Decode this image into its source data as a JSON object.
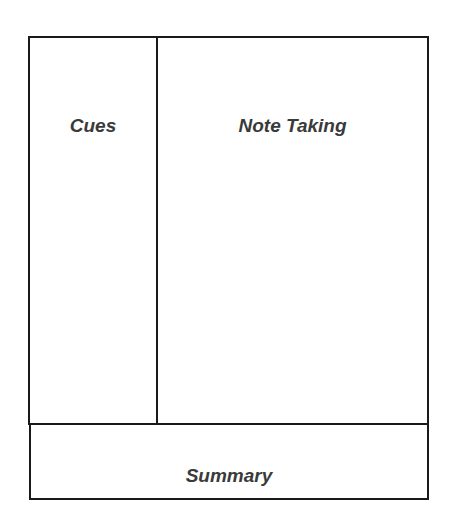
{
  "diagram": {
    "sections": {
      "cues": {
        "label": "Cues"
      },
      "note_taking": {
        "label": "Note Taking"
      },
      "summary": {
        "label": "Summary"
      }
    },
    "colors": {
      "line": "#1a1a1a",
      "text": "#3a3a3a",
      "background": "#ffffff"
    }
  }
}
